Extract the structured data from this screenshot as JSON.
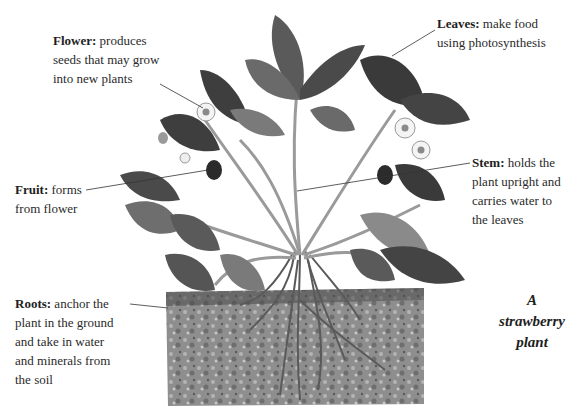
{
  "title": "A strawberry plant",
  "caption": {
    "line1": "A",
    "line2": "strawberry",
    "line3": "plant"
  },
  "labels": {
    "flower": {
      "term": "Flower:",
      "line1": " produces",
      "line2": "seeds that may grow",
      "line3": "into new plants"
    },
    "leaves": {
      "term": "Leaves:",
      "line1": " make food",
      "line2": "using photosynthesis"
    },
    "stem": {
      "term": "Stem:",
      "line1": " holds the",
      "line2": "plant upright and",
      "line3": "carries water to",
      "line4": "the leaves"
    },
    "fruit": {
      "term": "Fruit:",
      "line1": " forms",
      "line2": "from flower"
    },
    "roots": {
      "term": "Roots:",
      "line1": " anchor the",
      "line2": "plant in the ground",
      "line3": "and take in water",
      "line4": "and minerals from",
      "line5": "the soil"
    }
  },
  "colors": {
    "leaf_dark": "#3e3e3e",
    "leaf_mid": "#6a6a6a",
    "leaf_light": "#a8a8a8",
    "soil": "#8c8c8c",
    "flower": "#f4f4f4",
    "fruit": "#2b2b2b"
  }
}
